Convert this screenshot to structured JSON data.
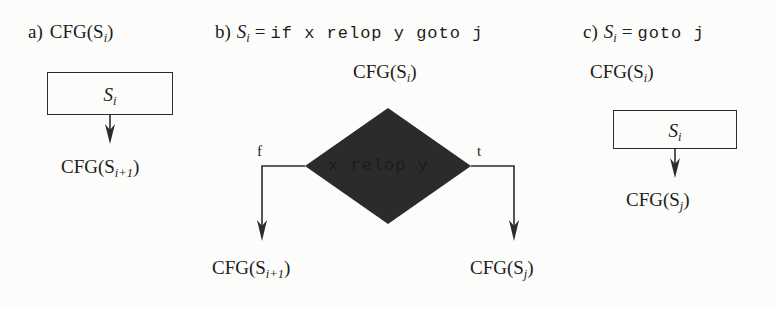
{
  "figure": {
    "background": "#fcfcfa",
    "ink": "#2b2b2b",
    "panels": [
      {
        "id": "a",
        "caption_prefix": "a)",
        "caption_body": "CFG(S",
        "caption_sub": "i",
        "caption_suffix": ")",
        "node_text": "S",
        "node_sub": "i",
        "successor_prefix": "CFG(S",
        "successor_sub": "i+1",
        "successor_suffix": ")"
      },
      {
        "id": "b",
        "caption_prefix": "b)",
        "caption_lhs": "S",
        "caption_lhs_sub": "i",
        "caption_eq": "=",
        "caption_code": "if x relop y goto j",
        "header_prefix": "CFG(S",
        "header_sub": "i",
        "header_suffix": ")",
        "diamond_text": "x relop y",
        "false_tag": "f",
        "true_tag": "t",
        "false_target_prefix": "CFG(S",
        "false_target_sub": "i+1",
        "false_target_suffix": ")",
        "true_target_prefix": "CFG(S",
        "true_target_sub": "j",
        "true_target_suffix": ")"
      },
      {
        "id": "c",
        "caption_prefix": "c)",
        "caption_lhs": "S",
        "caption_lhs_sub": "i",
        "caption_eq": "=",
        "caption_code": "goto j",
        "header_prefix": "CFG(S",
        "header_sub": "i",
        "header_suffix": ")",
        "node_text": "S",
        "node_sub": "i",
        "successor_prefix": "CFG(S",
        "successor_sub": "j",
        "successor_suffix": ")"
      }
    ]
  }
}
